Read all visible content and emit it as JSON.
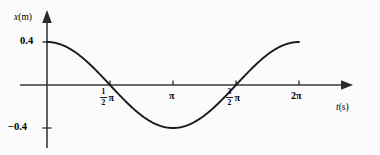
{
  "figure": {
    "name": "simple-harmonic-motion-displacement-graph",
    "background_color": "#fbfbfb",
    "curve_color": "#1a1a1a",
    "axis_color": "#3a3a3a"
  },
  "axes": {
    "y_label": "x",
    "y_unit": "(m)",
    "x_label": "t",
    "x_unit": "(s)",
    "y_tick_positive": "0.4",
    "y_tick_negative": "−0.4",
    "x_tick_1_numerator": "1",
    "x_tick_1_denominator": "2",
    "x_tick_1_symbol": "π",
    "x_tick_2": "π",
    "x_tick_3_numerator": "3",
    "x_tick_3_denominator": "2",
    "x_tick_3_symbol": "π",
    "x_tick_4": "2π"
  },
  "chart_data": {
    "type": "line",
    "title": "",
    "xlabel": "t(s)",
    "ylabel": "x(m)",
    "xlim": [
      0,
      7.2257
    ],
    "ylim": [
      -0.56,
      0.56
    ],
    "grid": false,
    "legend": null,
    "function": "x = 0.4*cos(t)",
    "amplitude": 0.4,
    "period": 6.2832,
    "x_tick_values": [
      1.5708,
      3.1416,
      4.7124,
      6.2832
    ],
    "x_tick_labels": [
      "1/2 π",
      "π",
      "3/2 π",
      "2π"
    ],
    "y_tick_values": [
      0.4,
      -0.4
    ],
    "y_tick_labels": [
      "0.4",
      "−0.4"
    ],
    "series": [
      {
        "name": "displacement",
        "x": [
          0,
          0.3927,
          0.7854,
          1.1781,
          1.5708,
          1.9635,
          2.3562,
          2.7489,
          3.1416,
          3.5343,
          3.927,
          4.3197,
          4.7124,
          5.1051,
          5.4978,
          5.8905,
          6.2832
        ],
        "values": [
          0.4,
          0.3696,
          0.2828,
          0.1531,
          0.0,
          -0.1531,
          -0.2828,
          -0.3696,
          -0.4,
          -0.3696,
          -0.2828,
          -0.1531,
          0.0,
          0.1531,
          0.2828,
          0.3696,
          0.4
        ]
      }
    ],
    "key_points": [
      {
        "label": "start-maximum",
        "x": 0,
        "y": 0.4
      },
      {
        "label": "zero-crossing-descending",
        "x": 1.5708,
        "y": 0
      },
      {
        "label": "minimum",
        "x": 3.1416,
        "y": -0.4
      },
      {
        "label": "zero-crossing-ascending",
        "x": 4.7124,
        "y": 0
      },
      {
        "label": "end-maximum",
        "x": 6.2832,
        "y": 0.4
      }
    ]
  }
}
